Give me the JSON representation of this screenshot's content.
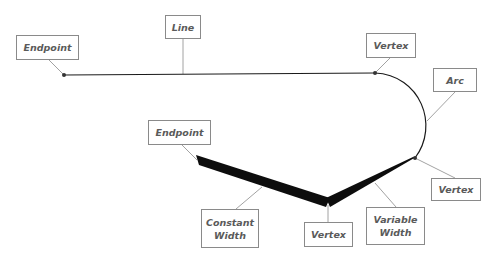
{
  "diagram": {
    "labels": {
      "endpoint_top": "Endpoint",
      "line": "Line",
      "vertex_top": "Vertex",
      "arc": "Arc",
      "endpoint_bottom": "Endpoint",
      "vertex_right": "Vertex",
      "constant_width": "Constant\nWidth",
      "vertex_bottom": "Vertex",
      "variable_width": "Variable\nWidth"
    },
    "colors": {
      "stroke": "#1a1a1a",
      "leader": "#8a8a8a",
      "label_text": "#5a5a5a",
      "label_border": "#8a8a8a"
    }
  }
}
